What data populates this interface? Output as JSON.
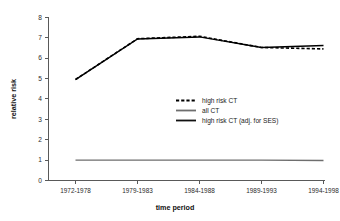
{
  "chart_data": {
    "type": "line",
    "title": "",
    "xlabel": "time period",
    "ylabel": "relative risk",
    "categories": [
      "1972-1978",
      "1979-1983",
      "1984-1988",
      "1989-1993",
      "1994-1998"
    ],
    "ylim": [
      0,
      8
    ],
    "yticks": [
      0,
      1,
      2,
      3,
      4,
      5,
      6,
      7,
      8
    ],
    "ytick_labels": [
      "0",
      "1",
      "2",
      "3",
      "4",
      "5",
      "6",
      "7",
      "8"
    ],
    "grid": false,
    "legend_position": "inside-center-right",
    "series": [
      {
        "name": "high risk CT",
        "style": "dashed",
        "color": "#000000",
        "values": [
          4.95,
          6.95,
          7.07,
          6.52,
          6.45
        ]
      },
      {
        "name": "all CT",
        "style": "solid",
        "color": "#6e6e6e",
        "values": [
          1.0,
          1.0,
          1.0,
          1.0,
          0.98
        ]
      },
      {
        "name": "high risk CT (adj. for SES)",
        "style": "solid",
        "color": "#000000",
        "values": [
          4.95,
          6.94,
          7.04,
          6.52,
          6.62
        ]
      }
    ]
  },
  "axes": {
    "y_title": "relative risk",
    "x_title": "time period",
    "y_ticks": [
      "0",
      "1",
      "2",
      "3",
      "4",
      "5",
      "6",
      "7",
      "8"
    ],
    "x_ticks": [
      "1972-1978",
      "1979-1983",
      "1984-1988",
      "1989-1993",
      "1994-1998"
    ]
  },
  "legend": {
    "items": [
      {
        "label": "high risk CT",
        "swatch": "dashed-line-swatch"
      },
      {
        "label": "all CT",
        "swatch": "solid-gray-line-swatch"
      },
      {
        "label": "high risk CT (adj. for SES)",
        "swatch": "solid-black-line-swatch"
      }
    ]
  },
  "colors": {
    "series_primary": "#000000",
    "series_secondary": "#6e6e6e",
    "axis": "#595959",
    "background": "#ffffff"
  }
}
